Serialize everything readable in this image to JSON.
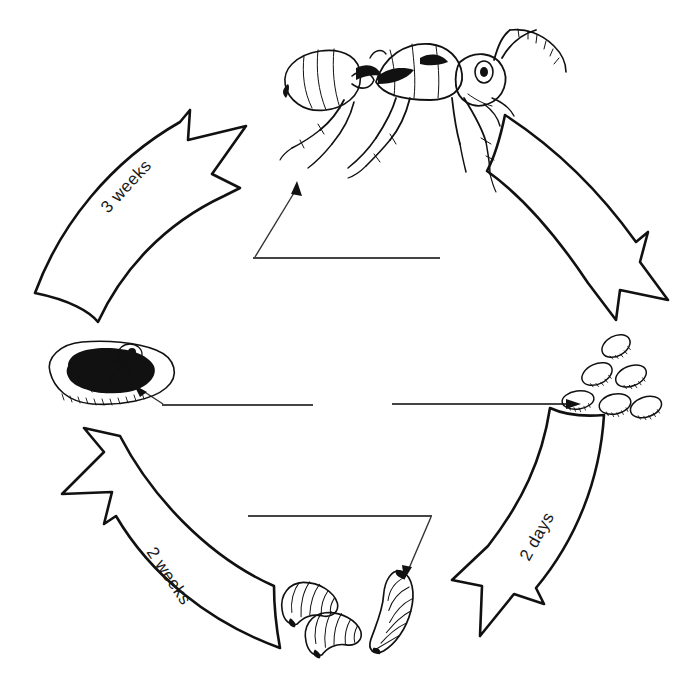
{
  "diagram": {
    "type": "cycle-diagram",
    "background_color": "#ffffff",
    "ink_color": "#111111",
    "label_line_color": "#444444"
  },
  "stages": [
    {
      "id": "adult",
      "name": "adult-ant",
      "icon": "adult-ant-illustration",
      "blank_label": "",
      "position": "top-center"
    },
    {
      "id": "egg",
      "name": "ant-eggs",
      "icon": "egg-cluster-illustration",
      "count": 6,
      "blank_label": "",
      "position": "middle-right"
    },
    {
      "id": "larva",
      "name": "ant-larvae",
      "icon": "larva-illustration",
      "count": 3,
      "blank_label": "",
      "position": "bottom-center"
    },
    {
      "id": "pupa",
      "name": "ant-pupa-cocoon",
      "icon": "pupa-cocoon-illustration",
      "blank_label": "",
      "position": "middle-left"
    }
  ],
  "arrows": [
    {
      "id": "pupa-to-adult",
      "name": "arrow-pupa-to-adult",
      "label": "3 weeks",
      "from": "pupa",
      "to": "adult",
      "direction": "up-right"
    },
    {
      "id": "adult-to-egg",
      "name": "arrow-adult-to-egg",
      "label": "",
      "from": "adult",
      "to": "egg",
      "direction": "down-right"
    },
    {
      "id": "egg-to-larva",
      "name": "arrow-egg-to-larva",
      "label": "2 days",
      "from": "egg",
      "to": "larva",
      "direction": "down-left"
    },
    {
      "id": "larva-to-pupa",
      "name": "arrow-larva-to-pupa",
      "label": "2 weeks",
      "from": "larva",
      "to": "pupa",
      "direction": "up-left"
    }
  ]
}
